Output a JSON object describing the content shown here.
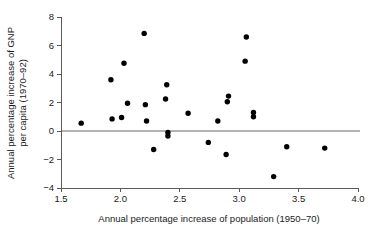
{
  "chart_data": {
    "type": "scatter",
    "title": "",
    "xlabel": "Annual percentage increase of population (1950–70)",
    "ylabel": "Annual percentage increase of GNP per capita (1970–92)",
    "ylabel_line1": "Annual percentage increase of GNP",
    "ylabel_line2": "per capita (1970–92)",
    "xlim": [
      1.5,
      4.0
    ],
    "ylim": [
      -4,
      8
    ],
    "xticks": [
      1.5,
      2.0,
      2.5,
      3.0,
      3.5,
      4.0
    ],
    "xtick_labels": [
      "1.5",
      "2.0",
      "2.5",
      "3.0",
      "3.5",
      "4.0"
    ],
    "yticks": [
      -4,
      -2,
      0,
      2,
      4,
      6,
      8
    ],
    "ytick_labels": [
      "−4",
      "−2",
      "0",
      "2",
      "4",
      "6",
      "8"
    ],
    "grid": false,
    "legend": null,
    "reference_lines": [
      {
        "name": "zero-line",
        "axis": "y",
        "value": 0,
        "color": "#b3b3b3"
      }
    ],
    "marker": {
      "shape": "circle",
      "color": "#000000",
      "radius": 2.7
    },
    "points": [
      {
        "x": 1.67,
        "y": 0.55
      },
      {
        "x": 1.92,
        "y": 3.6
      },
      {
        "x": 1.93,
        "y": 0.85
      },
      {
        "x": 2.01,
        "y": 0.95
      },
      {
        "x": 2.03,
        "y": 4.75
      },
      {
        "x": 2.06,
        "y": 1.95
      },
      {
        "x": 2.2,
        "y": 6.85
      },
      {
        "x": 2.21,
        "y": 1.85
      },
      {
        "x": 2.22,
        "y": 0.7
      },
      {
        "x": 2.28,
        "y": -1.3
      },
      {
        "x": 2.38,
        "y": 2.25
      },
      {
        "x": 2.39,
        "y": 3.25
      },
      {
        "x": 2.4,
        "y": -0.1
      },
      {
        "x": 2.4,
        "y": -0.35
      },
      {
        "x": 2.57,
        "y": 1.25
      },
      {
        "x": 2.74,
        "y": -0.8
      },
      {
        "x": 2.82,
        "y": 0.7
      },
      {
        "x": 2.89,
        "y": -1.65
      },
      {
        "x": 2.9,
        "y": 2.05
      },
      {
        "x": 2.91,
        "y": 2.45
      },
      {
        "x": 3.05,
        "y": 4.9
      },
      {
        "x": 3.06,
        "y": 6.6
      },
      {
        "x": 3.12,
        "y": 1.0
      },
      {
        "x": 3.12,
        "y": 1.3
      },
      {
        "x": 3.29,
        "y": -3.2
      },
      {
        "x": 3.4,
        "y": -1.1
      },
      {
        "x": 3.72,
        "y": -1.2
      }
    ],
    "n_points": 27,
    "geometry": {
      "plot_left_px": 61,
      "plot_right_px": 358,
      "plot_top_px": 17,
      "plot_bottom_px": 188
    }
  }
}
